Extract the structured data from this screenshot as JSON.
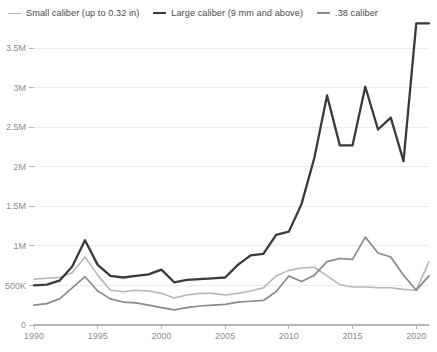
{
  "legend": {
    "position": "top-left",
    "items": [
      {
        "label": "Small caliber (up to 0.32 in)",
        "color": "#b7b7b7",
        "width": 1.6,
        "swatch": "line-swatch-small-caliber"
      },
      {
        "label": "Large caliber (9 mm and above)",
        "color": "#3a3a3a",
        "width": 2.4,
        "swatch": "line-swatch-large-caliber"
      },
      {
        "label": ".38 caliber",
        "color": "#8a8a8a",
        "width": 1.7,
        "swatch": "line-swatch-38-caliber"
      }
    ]
  },
  "axes": {
    "y_ticks": [
      "0",
      "500K",
      "1M",
      "1.5M",
      "2M",
      "2.5M",
      "3M",
      "3.5M"
    ],
    "x_ticks": [
      "1990",
      "1995",
      "2000",
      "2005",
      "2010",
      "2015",
      "2020"
    ]
  },
  "chart_data": {
    "type": "line",
    "title": "",
    "subtitle": "",
    "xlabel": "",
    "ylabel": "",
    "xlim": [
      1990,
      2021
    ],
    "ylim": [
      0,
      3900000
    ],
    "grid": true,
    "legend_position": "top-left",
    "y_tick_values": [
      0,
      500000,
      1000000,
      1500000,
      2000000,
      2500000,
      3000000,
      3500000
    ],
    "y_tick_labels": [
      "0",
      "500K",
      "1M",
      "1.5M",
      "2M",
      "2.5M",
      "3M",
      "3.5M"
    ],
    "x_tick_values": [
      1990,
      1995,
      2000,
      2005,
      2010,
      2015,
      2020
    ],
    "x_tick_labels": [
      "1990",
      "1995",
      "2000",
      "2005",
      "2010",
      "2015",
      "2020"
    ],
    "x": [
      1990,
      1991,
      1992,
      1993,
      1994,
      1995,
      1996,
      1997,
      1998,
      1999,
      2000,
      2001,
      2002,
      2003,
      2004,
      2005,
      2006,
      2007,
      2008,
      2009,
      2010,
      2011,
      2012,
      2013,
      2014,
      2015,
      2016,
      2017,
      2018,
      2019,
      2020,
      2021
    ],
    "series": [
      {
        "name": "Large caliber (9 mm and above)",
        "color": "#3a3a3a",
        "values": [
          500000,
          510000,
          560000,
          740000,
          1070000,
          760000,
          620000,
          600000,
          620000,
          640000,
          700000,
          540000,
          570000,
          580000,
          590000,
          600000,
          760000,
          880000,
          900000,
          1140000,
          1180000,
          1530000,
          2110000,
          2900000,
          2270000,
          2270000,
          3010000,
          2470000,
          2620000,
          2070000,
          3810000,
          3810000
        ]
      },
      {
        "name": "Small caliber (up to 0.32 in)",
        "color": "#b7b7b7",
        "values": [
          580000,
          590000,
          600000,
          660000,
          860000,
          630000,
          440000,
          420000,
          440000,
          430000,
          400000,
          340000,
          380000,
          400000,
          400000,
          380000,
          400000,
          430000,
          470000,
          620000,
          690000,
          720000,
          730000,
          620000,
          510000,
          480000,
          480000,
          470000,
          470000,
          450000,
          440000,
          800000
        ]
      },
      {
        "name": ".38 caliber",
        "color": "#8a8a8a",
        "values": [
          250000,
          270000,
          330000,
          470000,
          610000,
          430000,
          330000,
          290000,
          280000,
          250000,
          220000,
          190000,
          220000,
          240000,
          250000,
          260000,
          290000,
          300000,
          310000,
          420000,
          620000,
          550000,
          630000,
          800000,
          840000,
          830000,
          1110000,
          910000,
          860000,
          630000,
          440000,
          620000
        ]
      }
    ]
  }
}
